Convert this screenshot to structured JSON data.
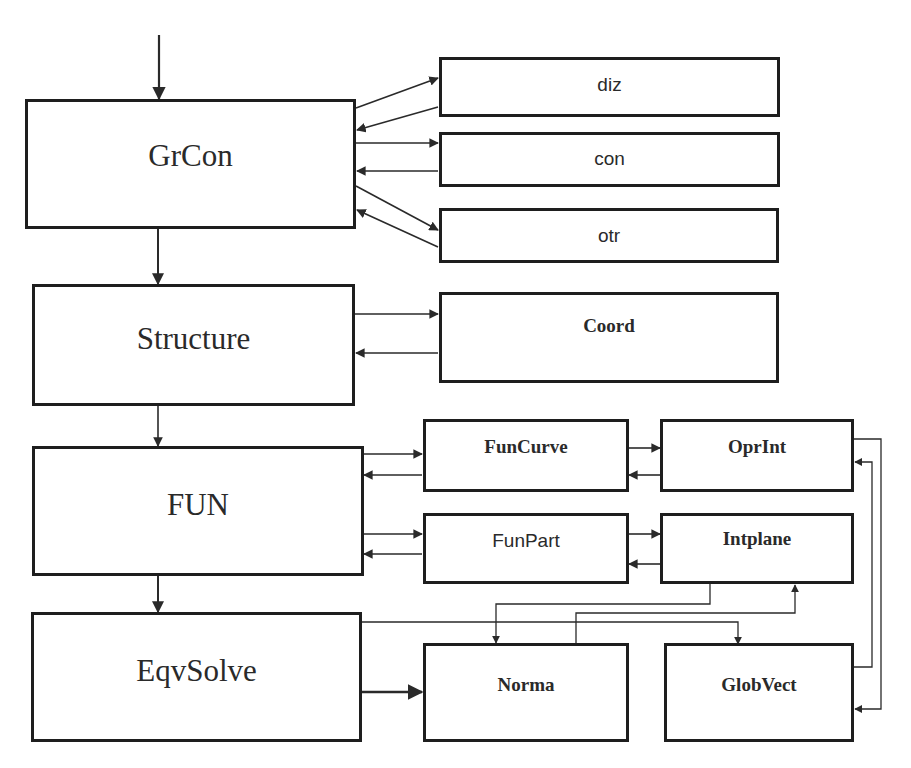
{
  "diagram": {
    "title": "",
    "colors": {
      "line": "#2a2a2a",
      "box_border": "#1e1e1e",
      "text": "#2a2a2a",
      "background": "#ffffff"
    },
    "main_blocks": [
      {
        "id": "grcon",
        "label": "GrCon"
      },
      {
        "id": "structure",
        "label": "Structure"
      },
      {
        "id": "fun",
        "label": "FUN"
      },
      {
        "id": "eqvsolve",
        "label": "EqvSolve"
      }
    ],
    "grcon_children": [
      {
        "id": "diz",
        "label": "diz"
      },
      {
        "id": "con",
        "label": "con"
      },
      {
        "id": "otr",
        "label": "otr"
      }
    ],
    "structure_children": [
      {
        "id": "coord",
        "label": "Coord"
      }
    ],
    "fun_children": [
      {
        "id": "funcurve",
        "label": "FunCurve"
      },
      {
        "id": "funpart",
        "label": "FunPart"
      },
      {
        "id": "oprint",
        "label": "OprInt"
      },
      {
        "id": "intplane",
        "label": "Intplane"
      }
    ],
    "solver_children": [
      {
        "id": "norma",
        "label": "Norma"
      },
      {
        "id": "globvect",
        "label": "GlobVect"
      }
    ],
    "edges": [
      {
        "from": "input",
        "to": "GrCon"
      },
      {
        "from": "GrCon",
        "to": "Structure"
      },
      {
        "from": "Structure",
        "to": "FUN"
      },
      {
        "from": "FUN",
        "to": "EqvSolve"
      },
      {
        "from": "GrCon",
        "to": "diz"
      },
      {
        "from": "diz",
        "to": "GrCon"
      },
      {
        "from": "GrCon",
        "to": "con"
      },
      {
        "from": "con",
        "to": "GrCon"
      },
      {
        "from": "GrCon",
        "to": "otr"
      },
      {
        "from": "otr",
        "to": "GrCon"
      },
      {
        "from": "Structure",
        "to": "Coord"
      },
      {
        "from": "Coord",
        "to": "Structure"
      },
      {
        "from": "FUN",
        "to": "FunCurve"
      },
      {
        "from": "FunCurve",
        "to": "FUN"
      },
      {
        "from": "FUN",
        "to": "FunPart"
      },
      {
        "from": "FunPart",
        "to": "FUN"
      },
      {
        "from": "FunCurve",
        "to": "OprInt"
      },
      {
        "from": "OprInt",
        "to": "FunCurve"
      },
      {
        "from": "FunPart",
        "to": "Intplane"
      },
      {
        "from": "Intplane",
        "to": "FunPart"
      },
      {
        "from": "Intplane",
        "to": "Norma"
      },
      {
        "from": "Norma",
        "to": "Intplane"
      },
      {
        "from": "EqvSolve",
        "to": "Norma"
      },
      {
        "from": "EqvSolve",
        "to": "GlobVect"
      },
      {
        "from": "GlobVect",
        "to": "OprInt"
      },
      {
        "from": "OprInt",
        "to": "GlobVect"
      }
    ]
  }
}
